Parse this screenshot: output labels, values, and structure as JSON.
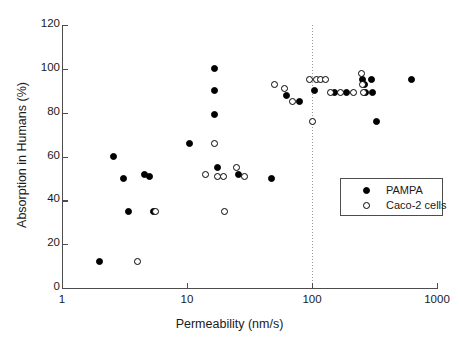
{
  "chart_data": {
    "type": "scatter",
    "title": "",
    "xlabel": "Permeability (nm/s)",
    "ylabel": "Absorption in Humans (%)",
    "xscale": "log",
    "xlim": [
      1,
      1000
    ],
    "ylim": [
      0,
      120
    ],
    "xticks": [
      1,
      10,
      100,
      1000
    ],
    "xticklabels": [
      "1",
      "10",
      "100",
      "1000"
    ],
    "yticks": [
      0,
      20,
      40,
      60,
      80,
      100,
      120
    ],
    "yticklabels": [
      "0",
      "20",
      "40",
      "60",
      "80",
      "100",
      "120"
    ],
    "grid": false,
    "legend_position": "lower right",
    "annotations": [
      {
        "type": "vline",
        "x": 100,
        "style": "dotted",
        "color": "#999999"
      }
    ],
    "series": [
      {
        "name": "PAMPA",
        "marker": "filled-circle",
        "color": "#000000",
        "points": [
          [
            2.0,
            12
          ],
          [
            2.6,
            60
          ],
          [
            3.1,
            50
          ],
          [
            3.4,
            35
          ],
          [
            4.6,
            52
          ],
          [
            5.0,
            51
          ],
          [
            5.4,
            35
          ],
          [
            10.5,
            66
          ],
          [
            16.5,
            90
          ],
          [
            16.5,
            79
          ],
          [
            16.6,
            100
          ],
          [
            17.5,
            55
          ],
          [
            26.0,
            52
          ],
          [
            47.0,
            50
          ],
          [
            62.0,
            88
          ],
          [
            80.0,
            85
          ],
          [
            105.0,
            90
          ],
          [
            150.0,
            89
          ],
          [
            190.0,
            89
          ],
          [
            255.0,
            95
          ],
          [
            262.0,
            93
          ],
          [
            268.0,
            89
          ],
          [
            300.0,
            95
          ],
          [
            305.0,
            89
          ],
          [
            330.0,
            76
          ],
          [
            620.0,
            95
          ]
        ]
      },
      {
        "name": "Caco-2 cells",
        "marker": "open-circle",
        "color": "#000000",
        "points": [
          [
            4.0,
            12
          ],
          [
            5.6,
            35
          ],
          [
            14.0,
            52
          ],
          [
            16.5,
            66
          ],
          [
            17.5,
            51
          ],
          [
            19.5,
            51
          ],
          [
            20.0,
            35
          ],
          [
            25.0,
            55
          ],
          [
            29.0,
            51
          ],
          [
            50.0,
            93
          ],
          [
            60.0,
            91
          ],
          [
            70.0,
            85
          ],
          [
            96.0,
            95
          ],
          [
            100.0,
            76
          ],
          [
            108.0,
            95
          ],
          [
            118.0,
            95
          ],
          [
            128.0,
            95
          ],
          [
            140.0,
            89
          ],
          [
            168.0,
            89
          ],
          [
            215.0,
            89
          ],
          [
            250.0,
            98
          ],
          [
            252.0,
            93
          ],
          [
            258.0,
            89
          ]
        ]
      }
    ]
  },
  "legend": {
    "entries": [
      {
        "label": "PAMPA",
        "marker": "filled-circle"
      },
      {
        "label": "Caco-2 cells",
        "marker": "open-circle"
      }
    ]
  }
}
